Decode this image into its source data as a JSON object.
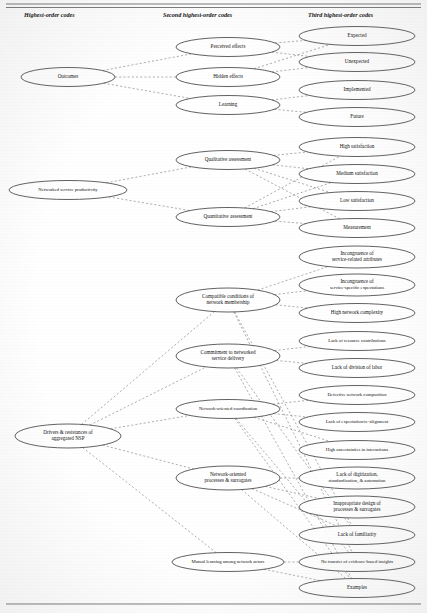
{
  "figure": {
    "column_headers": [
      {
        "id": "col1",
        "label": "Highest-order codes",
        "x": 24,
        "y": 17
      },
      {
        "id": "col2",
        "label": "Second highest-order codes",
        "x": 163,
        "y": 17
      },
      {
        "id": "col3",
        "label": "Third highest-order codes",
        "x": 308,
        "y": 17
      }
    ],
    "rules": [
      {
        "id": "top-rule-1",
        "x1": 6,
        "y1": 4,
        "x2": 421,
        "y2": 4
      },
      {
        "id": "top-rule-2",
        "x1": 6,
        "y1": 7.5,
        "x2": 421,
        "y2": 7.5
      },
      {
        "id": "bottom-rule",
        "x1": 6,
        "y1": 604,
        "x2": 421,
        "y2": 604
      }
    ],
    "nodes": [
      {
        "id": "outcomes",
        "label": "Outcomes",
        "column": 1,
        "cx": 68,
        "cy": 77,
        "rx": 47,
        "ry": 9.5,
        "lines": [
          "Outcomes"
        ]
      },
      {
        "id": "nsp",
        "label": "Networked service productivity",
        "column": 1,
        "cx": 68,
        "cy": 190,
        "rx": 59,
        "ry": 9.5,
        "lines": [
          "Networked service productivity"
        ]
      },
      {
        "id": "drivers",
        "label": "Drivers & resistances of aggregated NSP",
        "column": 1,
        "cx": 68,
        "cy": 436,
        "rx": 53,
        "ry": 12,
        "lines": [
          "Drivers & resistances of",
          "aggregated NSP"
        ]
      },
      {
        "id": "perceived-effects",
        "label": "Perceived effects",
        "column": 2,
        "cx": 228,
        "cy": 47,
        "rx": 52,
        "ry": 9.5,
        "lines": [
          "Perceived effects"
        ]
      },
      {
        "id": "hidden-effects",
        "label": "Hidden effects",
        "column": 2,
        "cx": 228,
        "cy": 77,
        "rx": 52,
        "ry": 9.5,
        "lines": [
          "Hidden effects"
        ]
      },
      {
        "id": "learning",
        "label": "Learning",
        "column": 2,
        "cx": 228,
        "cy": 105,
        "rx": 52,
        "ry": 9.5,
        "lines": [
          "Learning"
        ]
      },
      {
        "id": "qualitative-assessment",
        "label": "Qualitative assessment",
        "column": 2,
        "cx": 228,
        "cy": 160,
        "rx": 52,
        "ry": 9.5,
        "lines": [
          "Qualitative assessment"
        ]
      },
      {
        "id": "quantitative-assessment",
        "label": "Quantitative assessment",
        "column": 2,
        "cx": 228,
        "cy": 217,
        "rx": 52,
        "ry": 9.5,
        "lines": [
          "Quantitative assessment"
        ]
      },
      {
        "id": "compatible-conditions",
        "label": "Compatible conditions of network membership",
        "column": 2,
        "cx": 228,
        "cy": 300,
        "rx": 52,
        "ry": 12,
        "lines": [
          "Compatible conditions of",
          "network membership"
        ]
      },
      {
        "id": "commitment",
        "label": "Commitment to networked service delivery",
        "column": 2,
        "cx": 228,
        "cy": 356,
        "rx": 52,
        "ry": 12,
        "lines": [
          "Commitment to networked",
          "service delivery"
        ]
      },
      {
        "id": "network-coordination",
        "label": "Network-oriented coordination",
        "column": 2,
        "cx": 228,
        "cy": 409,
        "rx": 52,
        "ry": 9.5,
        "lines": [
          "Network-oriented coordination"
        ]
      },
      {
        "id": "network-processes",
        "label": "Network-oriented processes & surrogates",
        "column": 2,
        "cx": 228,
        "cy": 478,
        "rx": 52,
        "ry": 12,
        "lines": [
          "Network-oriented",
          "processes & surrogates"
        ]
      },
      {
        "id": "mutual-learning",
        "label": "Mutual learning among network actors",
        "column": 2,
        "cx": 228,
        "cy": 562,
        "rx": 56,
        "ry": 9.5,
        "lines": [
          "Mutual learning among network actors"
        ]
      },
      {
        "id": "expected",
        "label": "Expected",
        "column": 3,
        "cx": 357,
        "cy": 36,
        "rx": 58,
        "ry": 9.5,
        "lines": [
          "Expected"
        ]
      },
      {
        "id": "unexpected",
        "label": "Unexpected",
        "column": 3,
        "cx": 357,
        "cy": 62,
        "rx": 58,
        "ry": 9.5,
        "lines": [
          "Unexpected"
        ]
      },
      {
        "id": "implemented",
        "label": "Implemented",
        "column": 3,
        "cx": 357,
        "cy": 90,
        "rx": 58,
        "ry": 9.5,
        "lines": [
          "Implemented"
        ]
      },
      {
        "id": "future",
        "label": "Future",
        "column": 3,
        "cx": 357,
        "cy": 117,
        "rx": 58,
        "ry": 9.5,
        "lines": [
          "Future"
        ]
      },
      {
        "id": "high-satisfaction",
        "label": "High satisfaction",
        "column": 3,
        "cx": 357,
        "cy": 147,
        "rx": 58,
        "ry": 9.5,
        "lines": [
          "High satisfaction"
        ]
      },
      {
        "id": "medium-satisfaction",
        "label": "Medium satisfaction",
        "column": 3,
        "cx": 357,
        "cy": 174,
        "rx": 58,
        "ry": 9.5,
        "lines": [
          "Medium satisfaction"
        ]
      },
      {
        "id": "low-satisfaction",
        "label": "Low satisfaction",
        "column": 3,
        "cx": 357,
        "cy": 201,
        "rx": 58,
        "ry": 9.5,
        "lines": [
          "Low satisfaction"
        ]
      },
      {
        "id": "measurement",
        "label": "Measurement",
        "column": 3,
        "cx": 357,
        "cy": 228,
        "rx": 58,
        "ry": 9.5,
        "lines": [
          "Measurement"
        ]
      },
      {
        "id": "incongruence-attributes",
        "label": "Incongruence of service-related attributes",
        "column": 3,
        "cx": 357,
        "cy": 257,
        "rx": 58,
        "ry": 11,
        "lines": [
          "Incongruence of",
          "service-related attributes"
        ]
      },
      {
        "id": "incongruence-expectations",
        "label": "Incongruence of service-specific expectations",
        "column": 3,
        "cx": 357,
        "cy": 285,
        "rx": 58,
        "ry": 11,
        "lines": [
          "Incongruence of",
          "service-specific expectations"
        ]
      },
      {
        "id": "high-network-complexity",
        "label": "High network complexity",
        "column": 3,
        "cx": 357,
        "cy": 313,
        "rx": 58,
        "ry": 9.5,
        "lines": [
          "High network complexity"
        ]
      },
      {
        "id": "lack-resource-contributions",
        "label": "Lack of resource contributions",
        "column": 3,
        "cx": 357,
        "cy": 341,
        "rx": 58,
        "ry": 9.5,
        "lines": [
          "Lack of resource contributions"
        ]
      },
      {
        "id": "lack-division-labor",
        "label": "Lack of division of labor",
        "column": 3,
        "cx": 357,
        "cy": 368,
        "rx": 58,
        "ry": 9.5,
        "lines": [
          "Lack of division of labor"
        ]
      },
      {
        "id": "defective-network-composition",
        "label": "Defective network composition",
        "column": 3,
        "cx": 357,
        "cy": 395,
        "rx": 58,
        "ry": 9.5,
        "lines": [
          "Defective network composition"
        ]
      },
      {
        "id": "lack-expectation-alignment",
        "label": "Lack of expectation/re-alignment",
        "column": 3,
        "cx": 357,
        "cy": 422,
        "rx": 58,
        "ry": 9.5,
        "lines": [
          "Lack of expectation/re-alignment"
        ]
      },
      {
        "id": "high-uncertainties",
        "label": "High uncertainties in interactions",
        "column": 3,
        "cx": 357,
        "cy": 450,
        "rx": 58,
        "ry": 9.5,
        "lines": [
          "High uncertainties in interactions"
        ]
      },
      {
        "id": "lack-digitization",
        "label": "Lack of digitization, standardization, & automation",
        "column": 3,
        "cx": 357,
        "cy": 478,
        "rx": 58,
        "ry": 11,
        "lines": [
          "Lack of digitization,",
          "standardization, & automation"
        ]
      },
      {
        "id": "inappropriate-design",
        "label": "Inappropriate design of processes & surrogates",
        "column": 3,
        "cx": 357,
        "cy": 507,
        "rx": 58,
        "ry": 11,
        "lines": [
          "Inappropriate design of",
          "processes & surrogates"
        ]
      },
      {
        "id": "lack-familiarity",
        "label": "Lack of familiarity",
        "column": 3,
        "cx": 357,
        "cy": 535,
        "rx": 58,
        "ry": 9.5,
        "lines": [
          "Lack of familiarity"
        ]
      },
      {
        "id": "no-transfer-insights",
        "label": "No transfer of evidence-based insights",
        "column": 3,
        "cx": 357,
        "cy": 562,
        "rx": 58,
        "ry": 9.5,
        "lines": [
          "No transfer of evidence-based insights"
        ]
      },
      {
        "id": "examples",
        "label": "Examples",
        "column": 3,
        "cx": 357,
        "cy": 588,
        "rx": 58,
        "ry": 9.5,
        "lines": [
          "Examples"
        ]
      }
    ],
    "edges": [
      {
        "id": "e1",
        "from": "outcomes",
        "to": "perceived-effects"
      },
      {
        "id": "e2",
        "from": "outcomes",
        "to": "hidden-effects"
      },
      {
        "id": "e3",
        "from": "outcomes",
        "to": "learning"
      },
      {
        "id": "e4",
        "from": "perceived-effects",
        "to": "expected"
      },
      {
        "id": "e5",
        "from": "perceived-effects",
        "to": "unexpected"
      },
      {
        "id": "e6",
        "from": "hidden-effects",
        "to": "expected"
      },
      {
        "id": "e7",
        "from": "hidden-effects",
        "to": "unexpected"
      },
      {
        "id": "e8",
        "from": "learning",
        "to": "implemented"
      },
      {
        "id": "e9",
        "from": "learning",
        "to": "future"
      },
      {
        "id": "e10",
        "from": "nsp",
        "to": "qualitative-assessment"
      },
      {
        "id": "e11",
        "from": "nsp",
        "to": "quantitative-assessment"
      },
      {
        "id": "e12",
        "from": "qualitative-assessment",
        "to": "high-satisfaction"
      },
      {
        "id": "e13",
        "from": "qualitative-assessment",
        "to": "medium-satisfaction"
      },
      {
        "id": "e14",
        "from": "qualitative-assessment",
        "to": "low-satisfaction"
      },
      {
        "id": "e15",
        "from": "qualitative-assessment",
        "to": "measurement"
      },
      {
        "id": "e16",
        "from": "quantitative-assessment",
        "to": "high-satisfaction"
      },
      {
        "id": "e17",
        "from": "quantitative-assessment",
        "to": "medium-satisfaction"
      },
      {
        "id": "e18",
        "from": "quantitative-assessment",
        "to": "low-satisfaction"
      },
      {
        "id": "e19",
        "from": "quantitative-assessment",
        "to": "measurement"
      },
      {
        "id": "e20",
        "from": "drivers",
        "to": "compatible-conditions"
      },
      {
        "id": "e21",
        "from": "drivers",
        "to": "commitment"
      },
      {
        "id": "e22",
        "from": "drivers",
        "to": "network-coordination"
      },
      {
        "id": "e23",
        "from": "drivers",
        "to": "network-processes"
      },
      {
        "id": "e24",
        "from": "drivers",
        "to": "mutual-learning"
      },
      {
        "id": "e25",
        "from": "compatible-conditions",
        "to": "incongruence-attributes"
      },
      {
        "id": "e26",
        "from": "compatible-conditions",
        "to": "incongruence-expectations"
      },
      {
        "id": "e27",
        "from": "compatible-conditions",
        "to": "high-network-complexity"
      },
      {
        "id": "e28",
        "from": "commitment",
        "to": "lack-resource-contributions"
      },
      {
        "id": "e29",
        "from": "commitment",
        "to": "lack-division-labor"
      },
      {
        "id": "e30",
        "from": "network-coordination",
        "to": "defective-network-composition"
      },
      {
        "id": "e31",
        "from": "network-coordination",
        "to": "lack-expectation-alignment"
      },
      {
        "id": "e32",
        "from": "network-coordination",
        "to": "high-uncertainties"
      },
      {
        "id": "e33",
        "from": "network-processes",
        "to": "lack-digitization"
      },
      {
        "id": "e34",
        "from": "network-processes",
        "to": "inappropriate-design"
      },
      {
        "id": "e35",
        "from": "network-processes",
        "to": "lack-familiarity"
      },
      {
        "id": "e36",
        "from": "mutual-learning",
        "to": "no-transfer-insights"
      },
      {
        "id": "e37",
        "from": "mutual-learning",
        "to": "examples"
      },
      {
        "id": "e38",
        "from": "compatible-conditions",
        "to": "lack-familiarity"
      },
      {
        "id": "e39",
        "from": "compatible-conditions",
        "to": "no-transfer-insights"
      },
      {
        "id": "e40",
        "from": "commitment",
        "to": "lack-familiarity"
      },
      {
        "id": "e41",
        "from": "commitment",
        "to": "examples"
      },
      {
        "id": "e42",
        "from": "network-coordination",
        "to": "no-transfer-insights"
      },
      {
        "id": "e43",
        "from": "network-coordination",
        "to": "examples"
      },
      {
        "id": "e44",
        "from": "network-processes",
        "to": "examples"
      }
    ],
    "colors": {
      "node_stroke": "#2e2e2e",
      "edge_stroke": "#8d8d8d",
      "text": "#111111",
      "rule": "#6b6b6b",
      "background": "#ffffff"
    }
  }
}
